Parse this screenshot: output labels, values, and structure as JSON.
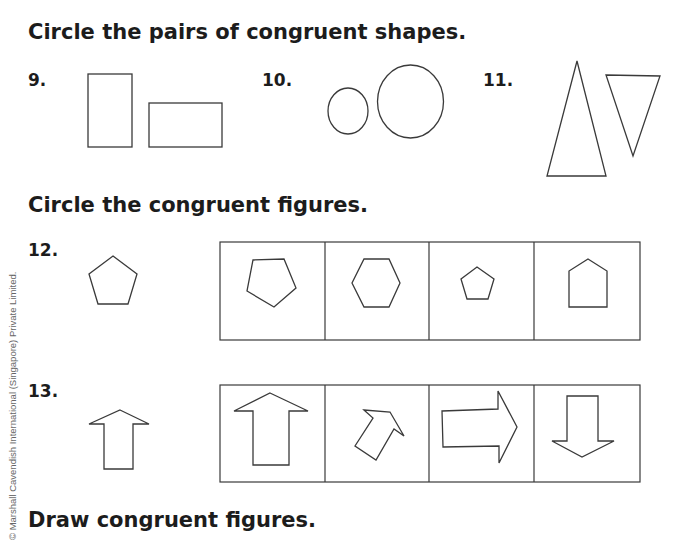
{
  "section1": {
    "heading": "Circle the pairs of congruent shapes.",
    "problems": [
      {
        "number": "9.",
        "shapes": [
          "tall-rectangle",
          "wide-rectangle"
        ]
      },
      {
        "number": "10.",
        "shapes": [
          "small-ellipse",
          "large-circle"
        ]
      },
      {
        "number": "11.",
        "shapes": [
          "tall-triangle",
          "inverted-triangle"
        ]
      }
    ]
  },
  "section2": {
    "heading": "Circle the congruent figures.",
    "problems": [
      {
        "number": "12.",
        "reference": "pentagon",
        "options": [
          "rotated-pentagon",
          "hexagon",
          "small-pentagon",
          "house-pentagon"
        ]
      },
      {
        "number": "13.",
        "reference": "up-arrow",
        "options": [
          "large-up-arrow",
          "rotated-arrow",
          "right-arrow",
          "down-arrow"
        ]
      }
    ]
  },
  "section3": {
    "heading": "Draw congruent figures."
  },
  "copyright": "© Marshall Cavendish International (Singapore) Private Limited."
}
